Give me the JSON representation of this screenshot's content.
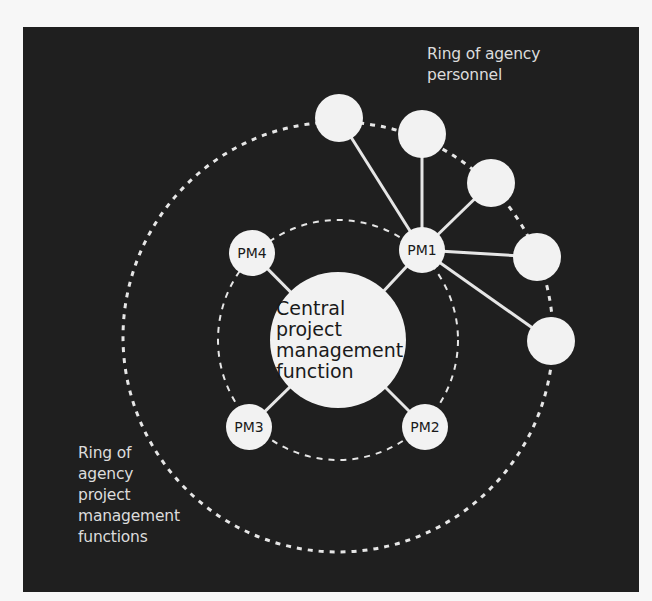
{
  "diagram": {
    "background_color": "#1f1f1f",
    "node_color": "#f2f2f2",
    "line_color": "#e6e6e6",
    "center": {
      "label_lines": [
        "Central",
        "project",
        "management",
        "function"
      ],
      "x": 338,
      "y": 340,
      "r": 68
    },
    "inner_ring": {
      "cx": 338,
      "cy": 340,
      "r": 120,
      "style": "dashed"
    },
    "outer_ring": {
      "cx": 338,
      "cy": 337,
      "r": 215,
      "style": "dashed"
    },
    "pm_nodes": [
      {
        "id": "PM1",
        "label": "PM1",
        "x": 422,
        "y": 250,
        "r": 23
      },
      {
        "id": "PM2",
        "label": "PM2",
        "x": 425,
        "y": 427,
        "r": 23
      },
      {
        "id": "PM3",
        "label": "PM3",
        "x": 249,
        "y": 427,
        "r": 23
      },
      {
        "id": "PM4",
        "label": "PM4",
        "x": 252,
        "y": 253,
        "r": 23
      }
    ],
    "personnel_nodes": [
      {
        "x": 339,
        "y": 118,
        "r": 24
      },
      {
        "x": 422,
        "y": 134,
        "r": 24
      },
      {
        "x": 491,
        "y": 183,
        "r": 24
      },
      {
        "x": 537,
        "y": 257,
        "r": 24
      },
      {
        "x": 551,
        "y": 341,
        "r": 24
      }
    ],
    "edges": [
      {
        "from": "center",
        "to": "PM1"
      },
      {
        "from": "center",
        "to": "PM2"
      },
      {
        "from": "center",
        "to": "PM3"
      },
      {
        "from": "center",
        "to": "PM4"
      },
      {
        "from": "PM1",
        "to": "personnel-0"
      },
      {
        "from": "PM1",
        "to": "personnel-1"
      },
      {
        "from": "PM1",
        "to": "personnel-2"
      },
      {
        "from": "PM1",
        "to": "personnel-3"
      },
      {
        "from": "PM1",
        "to": "personnel-4"
      }
    ]
  },
  "labels": {
    "personnel_ring": [
      "Ring of agency",
      "personnel"
    ],
    "pm_ring": [
      "Ring of",
      "agency",
      "project",
      "management",
      "functions"
    ]
  }
}
